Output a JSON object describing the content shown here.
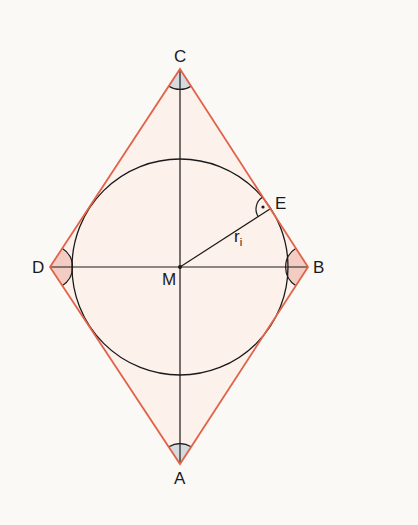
{
  "diagram": {
    "colors": {
      "background": "#fbf9f6",
      "rhombus_stroke": "#e0634a",
      "rhombus_fill": "#fbe9e3",
      "line_stroke": "#1a1a1a",
      "angle_fill_side": "#f2c9c0",
      "angle_fill_top": "#d8dde0"
    },
    "points": {
      "C": {
        "label": "C",
        "x": 180,
        "y": 69
      },
      "B": {
        "label": "B",
        "x": 308,
        "y": 267
      },
      "A": {
        "label": "A",
        "x": 180,
        "y": 464
      },
      "D": {
        "label": "D",
        "x": 50,
        "y": 267
      },
      "M": {
        "label": "M",
        "x": 180,
        "y": 267
      },
      "E": {
        "label": "E",
        "x": 270,
        "y": 209
      }
    },
    "incircle": {
      "cx": 180,
      "cy": 267,
      "r": 108
    },
    "radius_label": {
      "main": "r",
      "subscript": "i"
    },
    "right_angle_marker": "dot"
  }
}
